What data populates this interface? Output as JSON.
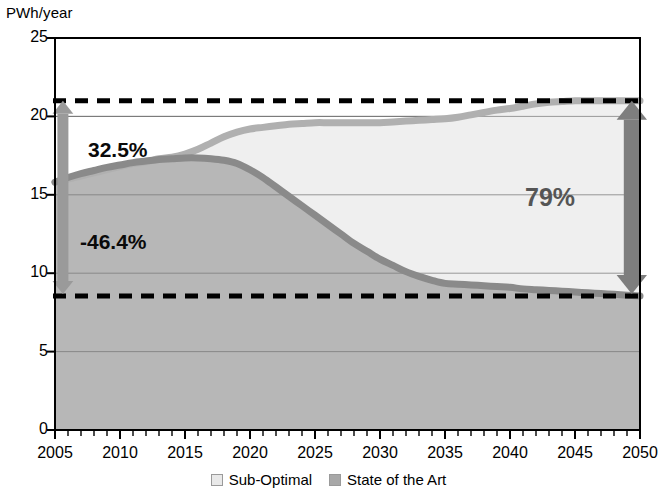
{
  "chart_data": {
    "type": "area",
    "title": "",
    "subtitle": "",
    "xlabel": "",
    "ylabel": "PWh/year",
    "xlim": [
      2005,
      2050
    ],
    "ylim": [
      0,
      25
    ],
    "grid": true,
    "legend_position": "bottom",
    "ytick_labels": [
      "0",
      "5",
      "10",
      "15",
      "20",
      "25"
    ],
    "ytick_values": [
      0,
      5,
      10,
      15,
      20,
      25
    ],
    "xtick_labels": [
      "2005",
      "2010",
      "2015",
      "2020",
      "2025",
      "2030",
      "2035",
      "2040",
      "2045",
      "2050"
    ],
    "xtick_values": [
      2005,
      2010,
      2015,
      2020,
      2025,
      2030,
      2035,
      2040,
      2045,
      2050
    ],
    "minor_tick_interval": 1,
    "x": [
      2005,
      2006,
      2007,
      2008,
      2009,
      2010,
      2011,
      2012,
      2013,
      2014,
      2015,
      2016,
      2017,
      2018,
      2019,
      2020,
      2021,
      2022,
      2023,
      2024,
      2025,
      2026,
      2027,
      2028,
      2029,
      2030,
      2031,
      2032,
      2033,
      2034,
      2035,
      2036,
      2037,
      2038,
      2039,
      2040,
      2041,
      2042,
      2043,
      2044,
      2045,
      2046,
      2047,
      2048,
      2049,
      2050
    ],
    "series": [
      {
        "name": "Sub-Optimal",
        "color": "#efefef",
        "line_color": "#b0b0b0",
        "values": [
          15.8,
          16.0,
          16.2,
          16.4,
          16.6,
          16.8,
          17.0,
          17.1,
          17.3,
          17.4,
          17.6,
          17.9,
          18.3,
          18.7,
          19.0,
          19.2,
          19.3,
          19.4,
          19.5,
          19.55,
          19.6,
          19.6,
          19.6,
          19.6,
          19.6,
          19.6,
          19.65,
          19.7,
          19.75,
          19.8,
          19.85,
          19.95,
          20.1,
          20.25,
          20.4,
          20.5,
          20.65,
          20.8,
          20.9,
          20.95,
          21.0,
          21.0,
          21.0,
          21.0,
          21.0,
          21.0
        ]
      },
      {
        "name": "State of the Art",
        "color": "#b7b7b7",
        "line_color": "#8a8a8a",
        "values": [
          15.8,
          16.1,
          16.35,
          16.55,
          16.75,
          16.9,
          17.05,
          17.15,
          17.25,
          17.3,
          17.35,
          17.35,
          17.3,
          17.2,
          17.0,
          16.6,
          16.1,
          15.5,
          14.9,
          14.3,
          13.7,
          13.1,
          12.5,
          11.9,
          11.4,
          10.9,
          10.5,
          10.1,
          9.8,
          9.55,
          9.35,
          9.3,
          9.25,
          9.2,
          9.15,
          9.1,
          9.0,
          8.95,
          8.9,
          8.85,
          8.8,
          8.75,
          8.7,
          8.65,
          8.6,
          8.55
        ]
      }
    ],
    "reference_lines": [
      {
        "name": "upper-dashed",
        "value": 21.0,
        "style": "dashed",
        "color": "#000000"
      },
      {
        "name": "lower-dashed",
        "value": 8.55,
        "style": "dashed",
        "color": "#000000"
      }
    ],
    "annotations": [
      {
        "name": "growth-gap-label",
        "text": "32.5%",
        "x": 2007.5,
        "y": 18.9,
        "color": "#0a0a0a"
      },
      {
        "name": "reduction-label",
        "text": "-46.4%",
        "x": 2007.0,
        "y": 12.6,
        "color": "#0a0a0a"
      },
      {
        "name": "savings-label",
        "text": "79%",
        "x": 2040.0,
        "y": 14.6,
        "color": "#555555"
      },
      {
        "name": "left-arrow",
        "text": "",
        "from_y": 8.55,
        "to_y": 21.0,
        "x": 2005.3,
        "color": "#9a9a9a",
        "double_headed": true
      },
      {
        "name": "right-arrow",
        "text": "",
        "from_y": 8.55,
        "to_y": 21.0,
        "x": 2049.6,
        "color": "#7e7e7e",
        "double_headed": true
      }
    ]
  },
  "legend": {
    "items": [
      {
        "label": "Sub-Optimal",
        "swatch": "light-gray-square"
      },
      {
        "label": "State of the Art",
        "swatch": "dark-gray-square"
      }
    ]
  }
}
